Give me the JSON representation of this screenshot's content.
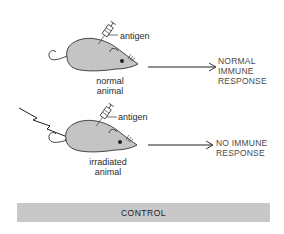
{
  "figure": {
    "panel_top": {
      "injection_label": "antigen",
      "animal_label_line1": "normal",
      "animal_label_line2": "animal",
      "result_line1": "NORMAL",
      "result_line2": "IMMUNE",
      "result_line3": "RESPONSE"
    },
    "panel_bottom": {
      "injection_label": "antigen",
      "animal_label_line1": "irradiated",
      "animal_label_line2": "animal",
      "result_line1": "NO IMMUNE",
      "result_line2": "RESPONSE"
    },
    "footer": {
      "label": "CONTROL"
    },
    "colors": {
      "mouse_fill": "#c4c4c4",
      "outline": "#333333",
      "bar_fill": "#c8c8c8"
    }
  }
}
